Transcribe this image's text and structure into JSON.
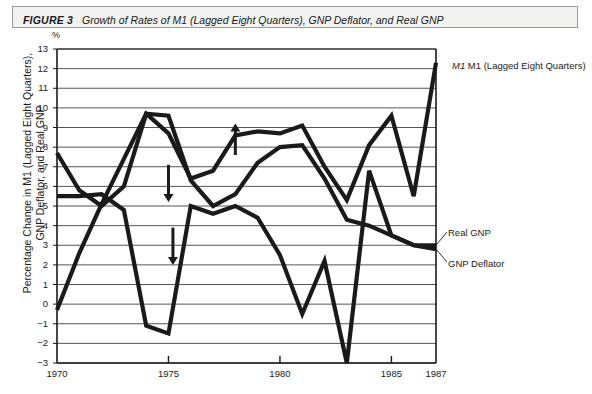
{
  "caption": {
    "figure_label": "FIGURE 3",
    "title": "Growth of Rates of M1 (Lagged Eight Quarters), GNP Deflator, and Real GNP"
  },
  "axis": {
    "unit_mark": "%",
    "y_title_line1": "Percentage Change in M1 (Lagged Eight Quarters),",
    "y_title_line2": "GNP Deflator, and Real GNP",
    "y_ticks": [
      "13",
      "12",
      "11",
      "10",
      "9",
      "8",
      "7",
      "6",
      "5",
      "4",
      "3",
      "2",
      "1",
      "0",
      "−1",
      "−2",
      "−3"
    ],
    "x_ticks": [
      "1970",
      "1975",
      "1980",
      "1985",
      "1987"
    ]
  },
  "series_labels": {
    "m1": "M1 (Lagged Eight Quarters)",
    "real_gnp": "Real GNP",
    "gnp_deflator": "GNP Deflator"
  },
  "colors": {
    "ink": "#1a1a1a",
    "grid": "#555555",
    "caption_fill": "#f2f2f0",
    "caption_border": "#9a9a9a"
  },
  "chart_data": {
    "type": "line",
    "title": "Growth of Rates of M1 (Lagged Eight Quarters), GNP Deflator, and Real GNP",
    "xlabel": "",
    "ylabel": "Percentage Change in M1 (Lagged Eight Quarters), GNP Deflator, and Real GNP",
    "xlim": [
      1970,
      1987
    ],
    "ylim": [
      -3,
      13
    ],
    "grid": true,
    "legend": "right-inline labels",
    "x": [
      1970,
      1971,
      1972,
      1973,
      1974,
      1975,
      1976,
      1977,
      1978,
      1979,
      1980,
      1981,
      1982,
      1983,
      1984,
      1985,
      1986,
      1987
    ],
    "series": [
      {
        "name": "M1 (Lagged Eight Quarters)",
        "values": [
          -0.3,
          2.6,
          5.1,
          7.4,
          9.7,
          8.7,
          6.4,
          6.8,
          8.6,
          8.8,
          8.7,
          9.1,
          7.0,
          5.3,
          8.1,
          9.6,
          5.5,
          12.3
        ]
      },
      {
        "name": "GNP Deflator",
        "values": [
          7.7,
          5.8,
          5.0,
          6.0,
          9.7,
          9.6,
          6.3,
          5.0,
          5.6,
          7.2,
          8.0,
          8.1,
          6.4,
          4.3,
          4.0,
          3.5,
          3.0,
          2.8
        ]
      },
      {
        "name": "Real GNP",
        "values": [
          5.5,
          5.5,
          5.6,
          4.8,
          -1.1,
          -1.5,
          5.0,
          4.6,
          5.0,
          4.4,
          2.5,
          -0.5,
          2.2,
          -3.0,
          6.8,
          3.5,
          3.0,
          3.0
        ]
      }
    ],
    "annotations": [
      {
        "kind": "down-arrow",
        "x": 1975.0,
        "y_from": 7.1,
        "y_to": 5.2
      },
      {
        "kind": "down-arrow",
        "x": 1975.2,
        "y_from": 3.9,
        "y_to": 2.0
      },
      {
        "kind": "up-arrow",
        "x": 1978.0,
        "y_from": 7.6,
        "y_to": 9.2
      }
    ]
  }
}
